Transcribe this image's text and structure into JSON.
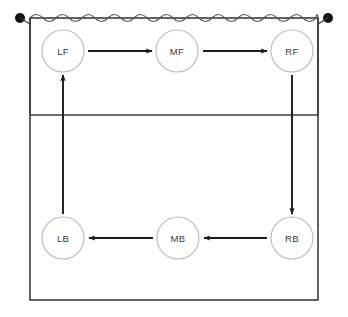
{
  "diagram": {
    "colors": {
      "court_line": "#3c3c3c",
      "net_line": "#5a5a5a",
      "post": "#111111",
      "circle_stroke": "#b8b8b8",
      "circle_fill": "#ffffff",
      "label_text": "#3a3a3a",
      "arrow": "#1c1c1c",
      "background": "#ffffff"
    },
    "court": {
      "left": 30,
      "right": 318,
      "top": 18,
      "bottom": 300,
      "attack_line_y": 115
    },
    "net": {
      "label": "net",
      "y": 18,
      "wave_period": 13,
      "wave_amplitude": 3.5,
      "left_post_x": 20,
      "right_post_x": 328,
      "post_radius": 5,
      "post_base_y": 115
    },
    "positions": [
      {
        "id": "LF",
        "label": "LF",
        "name": "left-front",
        "cx": 63,
        "cy": 51,
        "r": 21,
        "row": "front"
      },
      {
        "id": "MF",
        "label": "MF",
        "name": "middle-front",
        "cx": 177,
        "cy": 51,
        "r": 21,
        "row": "front"
      },
      {
        "id": "RF",
        "label": "RF",
        "name": "right-front",
        "cx": 292,
        "cy": 51,
        "r": 21,
        "row": "front"
      },
      {
        "id": "LB",
        "label": "LB",
        "name": "left-back",
        "cx": 63,
        "cy": 238,
        "r": 21,
        "row": "back"
      },
      {
        "id": "MB",
        "label": "MB",
        "name": "middle-back",
        "cx": 178,
        "cy": 238,
        "r": 21,
        "row": "back"
      },
      {
        "id": "RB",
        "label": "RB",
        "name": "right-back",
        "cx": 292,
        "cy": 238,
        "r": 21,
        "row": "back"
      }
    ],
    "arrows": [
      {
        "name": "arrow-lf-to-mf",
        "from": "LF",
        "to": "MF",
        "direction": "right",
        "x1": 88,
        "y1": 51,
        "x2": 152,
        "y2": 51
      },
      {
        "name": "arrow-mf-to-rf",
        "from": "MF",
        "to": "RF",
        "direction": "right",
        "x1": 203,
        "y1": 51,
        "x2": 267,
        "y2": 51
      },
      {
        "name": "arrow-rf-to-rb",
        "from": "RF",
        "to": "RB",
        "direction": "down",
        "x1": 292,
        "y1": 75,
        "x2": 292,
        "y2": 214
      },
      {
        "name": "arrow-rb-to-mb",
        "from": "RB",
        "to": "MB",
        "direction": "left",
        "x1": 267,
        "y1": 238,
        "x2": 204,
        "y2": 238
      },
      {
        "name": "arrow-mb-to-lb",
        "from": "MB",
        "to": "LB",
        "direction": "left",
        "x1": 153,
        "y1": 238,
        "x2": 89,
        "y2": 238
      },
      {
        "name": "arrow-lb-to-lf",
        "from": "LB",
        "to": "LF",
        "direction": "up",
        "x1": 63,
        "y1": 214,
        "x2": 63,
        "y2": 75
      }
    ]
  }
}
